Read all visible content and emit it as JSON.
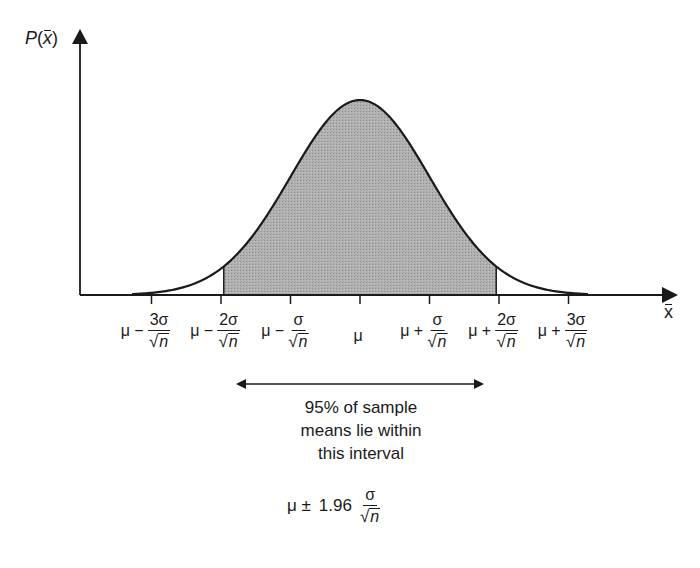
{
  "diagram": {
    "y_axis_label": "P(x̄)",
    "x_axis_label": "x",
    "colors": {
      "shade": "#a8a8a8",
      "line": "#1a1a1a",
      "background": "#ffffff"
    },
    "ticks": [
      {
        "prefix": "μ −",
        "num": "3σ",
        "den": "n"
      },
      {
        "prefix": "μ −",
        "num": "2σ",
        "den": "n"
      },
      {
        "prefix": "μ −",
        "num": "σ",
        "den": "n"
      },
      {
        "prefix": "μ",
        "num": "",
        "den": ""
      },
      {
        "prefix": "μ +",
        "num": "σ",
        "den": "n"
      },
      {
        "prefix": "μ +",
        "num": "2σ",
        "den": "n"
      },
      {
        "prefix": "μ +",
        "num": "3σ",
        "den": "n"
      }
    ],
    "shaded_region": {
      "from": "μ − 1.96σ/√n",
      "to": "μ + 1.96σ/√n",
      "coverage": "95%"
    },
    "annotation": [
      "95% of sample",
      "means lie within",
      "this interval"
    ],
    "formula": {
      "prefix": "μ ±",
      "coef": "1.96",
      "num": "σ",
      "den": "n"
    }
  }
}
